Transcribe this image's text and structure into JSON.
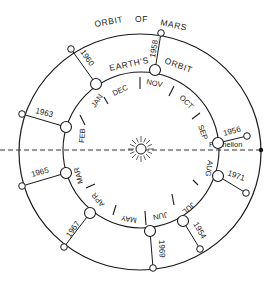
{
  "diagram": {
    "type": "orbital diagram",
    "labels": {
      "mars_orbit": [
        "ORBIT",
        "OF",
        "MARS"
      ],
      "earth_orbit": [
        "EARTH'S",
        "ORBIT"
      ],
      "perihelion": "Perihelion"
    },
    "center": {
      "name": "Sun",
      "icon": "sun-icon"
    },
    "months": [
      "JAN",
      "FEB",
      "MAR",
      "APR",
      "MAY",
      "JUN",
      "JUL",
      "AUG",
      "SEP",
      "OCT",
      "NOV",
      "DEC"
    ],
    "oppositions": [
      {
        "year": "1954",
        "month_region": "JUL"
      },
      {
        "year": "1956",
        "month_region": "SEP"
      },
      {
        "year": "1958",
        "month_region": "NOV"
      },
      {
        "year": "1960",
        "month_region": "DEC/JAN"
      },
      {
        "year": "1963",
        "month_region": "FEB"
      },
      {
        "year": "1965",
        "month_region": "MAR"
      },
      {
        "year": "1967",
        "month_region": "APR"
      },
      {
        "year": "1969",
        "month_region": "JUN"
      },
      {
        "year": "1971",
        "month_region": "AUG"
      }
    ],
    "colors": {
      "ink": "#1a1a1a",
      "background": "#ffffff"
    }
  }
}
